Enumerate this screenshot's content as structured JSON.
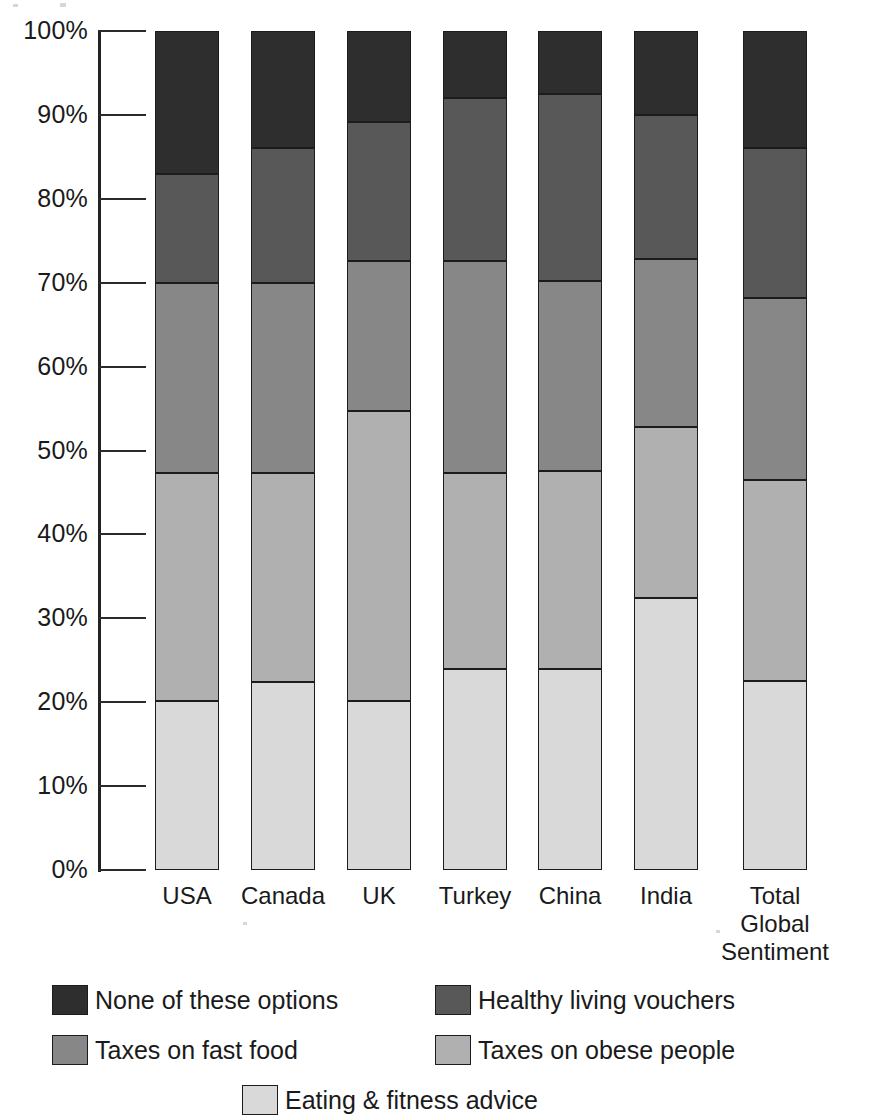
{
  "chart_data": {
    "type": "bar",
    "subtype": "stacked-percent",
    "title": "",
    "xlabel": "",
    "ylabel": "",
    "ylim": [
      0,
      100
    ],
    "grid": false,
    "legend_position": "bottom",
    "y_tick_labels": [
      "100%",
      "90%",
      "80%",
      "70%",
      "60%",
      "50%",
      "40%",
      "30%",
      "20%",
      "10%",
      "0%"
    ],
    "y_ticks": [
      100,
      90,
      80,
      70,
      60,
      50,
      40,
      30,
      20,
      10,
      0
    ],
    "categories": [
      "USA",
      "Canada",
      "UK",
      "Turkey",
      "China",
      "India",
      "Total Global Sentiment"
    ],
    "series": [
      {
        "name": "Eating & fitness advice",
        "color": "#d9d9d9",
        "values": [
          20.2,
          22.4,
          20.2,
          24.0,
          24.0,
          32.4,
          22.5
        ]
      },
      {
        "name": "Taxes on obese people",
        "color": "#b0b0b0",
        "values": [
          27.1,
          24.9,
          34.5,
          23.3,
          23.5,
          20.4,
          24.0
        ]
      },
      {
        "name": "Taxes on fast food",
        "color": "#878787",
        "values": [
          22.7,
          22.7,
          17.9,
          25.3,
          22.7,
          20.0,
          21.7
        ]
      },
      {
        "name": "Healthy living vouchers",
        "color": "#585858",
        "values": [
          13.0,
          16.0,
          16.6,
          19.4,
          22.3,
          17.2,
          17.8
        ]
      },
      {
        "name": "None of these options",
        "color": "#2e2e2e",
        "values": [
          17.0,
          14.0,
          10.8,
          8.0,
          7.5,
          10.0,
          14.0
        ]
      }
    ],
    "cumulative_boundaries": {
      "USA": [
        20.2,
        47.3,
        70.0,
        83.0,
        100
      ],
      "Canada": [
        22.4,
        47.3,
        70.0,
        86.0,
        100
      ],
      "UK": [
        20.2,
        54.7,
        72.6,
        89.2,
        100
      ],
      "Turkey": [
        24.0,
        47.3,
        72.6,
        92.0,
        100
      ],
      "China": [
        24.0,
        47.5,
        70.2,
        92.5,
        100
      ],
      "India": [
        32.4,
        52.8,
        72.8,
        90.0,
        100
      ],
      "Total Global Sentiment": [
        22.5,
        46.5,
        68.2,
        86.0,
        100
      ]
    }
  },
  "axis": {
    "ticks": [
      {
        "label": "100%",
        "value": 100
      },
      {
        "label": "90%",
        "value": 90
      },
      {
        "label": "80%",
        "value": 80
      },
      {
        "label": "70%",
        "value": 70
      },
      {
        "label": "60%",
        "value": 60
      },
      {
        "label": "50%",
        "value": 50
      },
      {
        "label": "40%",
        "value": 40
      },
      {
        "label": "30%",
        "value": 30
      },
      {
        "label": "20%",
        "value": 20
      },
      {
        "label": "10%",
        "value": 10
      },
      {
        "label": "0%",
        "value": 0
      }
    ]
  },
  "categories": [
    {
      "lines": [
        "USA"
      ]
    },
    {
      "lines": [
        "Canada"
      ]
    },
    {
      "lines": [
        "UK"
      ]
    },
    {
      "lines": [
        "Turkey"
      ]
    },
    {
      "lines": [
        "China"
      ]
    },
    {
      "lines": [
        "India"
      ]
    },
    {
      "lines": [
        "Total",
        "Global",
        "Sentiment"
      ]
    }
  ],
  "legend": {
    "items": [
      {
        "label": "None of these options",
        "color": "#2e2e2e",
        "col": 0,
        "row": 0
      },
      {
        "label": "Healthy living vouchers",
        "color": "#585858",
        "col": 1,
        "row": 0
      },
      {
        "label": "Taxes on fast food",
        "color": "#878787",
        "col": 0,
        "row": 1
      },
      {
        "label": "Taxes on obese people",
        "color": "#b0b0b0",
        "col": 1,
        "row": 1
      },
      {
        "label": "Eating & fitness advice",
        "color": "#d9d9d9",
        "col": 0,
        "row": 2
      }
    ]
  }
}
